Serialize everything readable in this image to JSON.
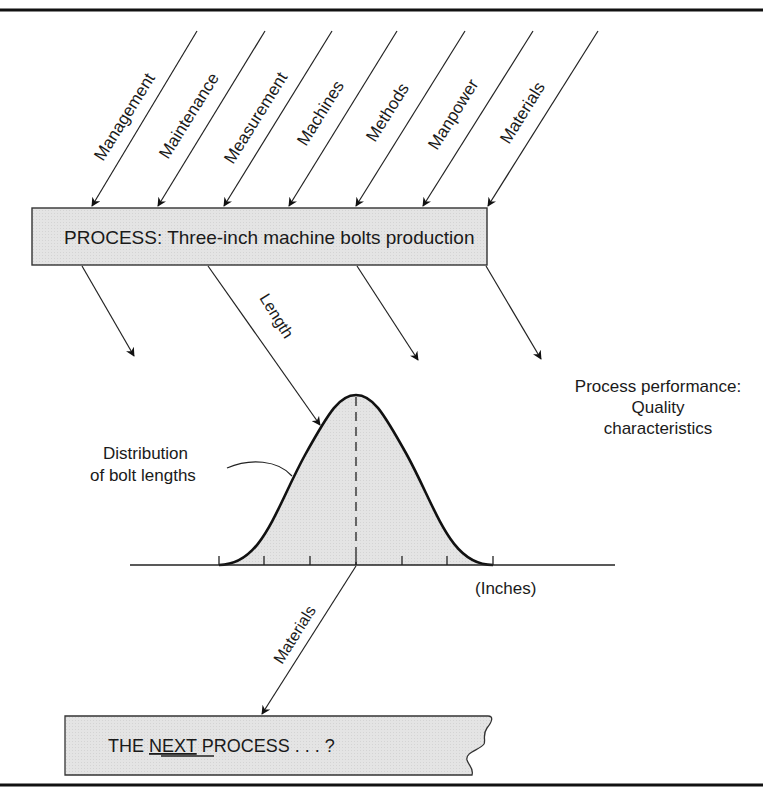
{
  "diagram": {
    "inputs": [
      {
        "label": "Management"
      },
      {
        "label": "Maintenance"
      },
      {
        "label": "Measurement"
      },
      {
        "label": "Machines"
      },
      {
        "label": "Methods"
      },
      {
        "label": "Manpower"
      },
      {
        "label": "Materials"
      }
    ],
    "process_box": {
      "label": "PROCESS: Three-inch machine bolts production",
      "fill": "#e6e6e6"
    },
    "output_length_label": "Length",
    "performance_label": {
      "line1": "Process performance:",
      "line2": "Quality",
      "line3": "characteristics"
    },
    "distribution": {
      "label_line1": "Distribution",
      "label_line2": "of bolt lengths",
      "axis_unit": "(Inches)",
      "fill": "#e6e6e6"
    },
    "materials_out_label": "Materials",
    "next_process": {
      "prefix": "THE ",
      "emphasis": "NEXT",
      "suffix": " PROCESS . . . ?"
    }
  }
}
